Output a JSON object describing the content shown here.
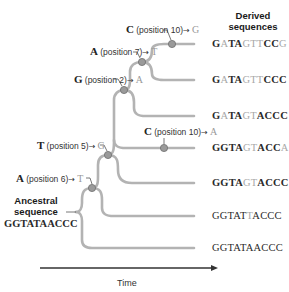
{
  "diagram": {
    "type": "phylogenetic-tree",
    "headings": {
      "derived": "Derived\nsequences",
      "derived_line1": "Derived",
      "derived_line2": "sequences",
      "ancestral_line1": "Ancestral",
      "ancestral_line2": "sequence"
    },
    "ancestral_sequence": "GGTATAACCC",
    "axis": {
      "label": "Time",
      "direction": "left-to-right"
    },
    "colors": {
      "branch": "#b3b3b3",
      "node_fill": "#9a9a9a",
      "node_stroke": "#6e6e6e",
      "text": "#222222",
      "mutated_base": "#a8a8a8",
      "axis": "#333333"
    },
    "mutations": [
      {
        "id": "m1",
        "from": "A",
        "position_text": "(position 6)",
        "to": "T"
      },
      {
        "id": "m2",
        "from": "T",
        "position_text": "(position 5)",
        "to": "G"
      },
      {
        "id": "m3",
        "from": "G",
        "position_text": "(position 2)",
        "to": "A"
      },
      {
        "id": "m4",
        "from": "A",
        "position_text": "(position 7)",
        "to": "T"
      },
      {
        "id": "m5",
        "from": "C",
        "position_text": "(position 10)",
        "to": "G"
      },
      {
        "id": "m6",
        "from": "C",
        "position_text": "(position 10)",
        "to": "A"
      }
    ],
    "derived_sequences": [
      {
        "parts": [
          {
            "t": "G",
            "m": false
          },
          {
            "t": "A",
            "m": true
          },
          {
            "t": "TA",
            "m": false
          },
          {
            "t": "GTT",
            "m": true
          },
          {
            "t": "CC",
            "m": false
          },
          {
            "t": "G",
            "m": true
          }
        ],
        "full": "GATAGTTCCG"
      },
      {
        "parts": [
          {
            "t": "G",
            "m": false
          },
          {
            "t": "A",
            "m": true
          },
          {
            "t": "TA",
            "m": false
          },
          {
            "t": "GTT",
            "m": true
          },
          {
            "t": "CCC",
            "m": false
          }
        ],
        "full": "GATAGTTCCC"
      },
      {
        "parts": [
          {
            "t": "G",
            "m": false
          },
          {
            "t": "A",
            "m": true
          },
          {
            "t": "TA",
            "m": false
          },
          {
            "t": "GT",
            "m": true
          },
          {
            "t": "ACCC",
            "m": false
          }
        ],
        "full": "GATAGTACCC"
      },
      {
        "parts": [
          {
            "t": "GGTA",
            "m": false
          },
          {
            "t": "GT",
            "m": true
          },
          {
            "t": "ACC",
            "m": false
          },
          {
            "t": "A",
            "m": true
          }
        ],
        "full": "GGTAGTACCA"
      },
      {
        "parts": [
          {
            "t": "GGTA",
            "m": false
          },
          {
            "t": "GT",
            "m": true
          },
          {
            "t": "ACCC",
            "m": false
          }
        ],
        "full": "GGTAGTACCC"
      },
      {
        "parts": [
          {
            "t": "GGTAT",
            "m": false
          },
          {
            "t": "T",
            "m": true
          },
          {
            "t": "ACCC",
            "m": false
          }
        ],
        "full": "GGTATTACCC"
      },
      {
        "parts": [
          {
            "t": "GGTATAACCC",
            "m": false
          }
        ],
        "full": "GGTATAACCC"
      }
    ]
  }
}
